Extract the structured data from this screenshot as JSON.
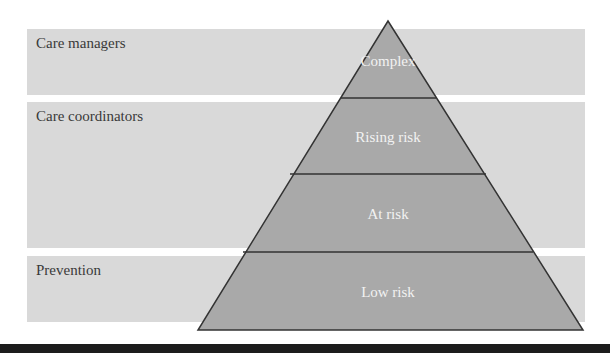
{
  "bands": [
    {
      "label": "Care managers"
    },
    {
      "label": "Care coordinators"
    },
    {
      "label": "Prevention"
    }
  ],
  "pyramid": {
    "tiers": [
      {
        "label": "Complex"
      },
      {
        "label": "Rising risk"
      },
      {
        "label": "At risk"
      },
      {
        "label": "Low risk"
      }
    ]
  },
  "colors": {
    "band_fill": "#d9d9d9",
    "pyramid_fill": "#a9a9a9",
    "pyramid_stroke": "#333333",
    "tier_text": "#f2f2f2"
  }
}
